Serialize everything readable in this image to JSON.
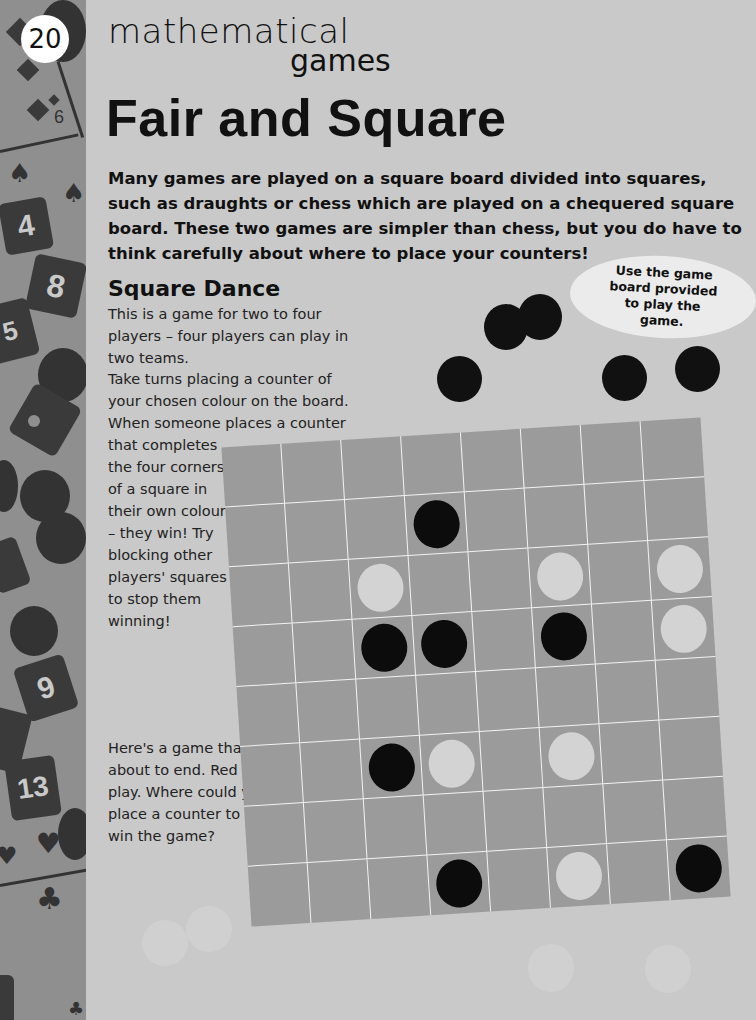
{
  "page": {
    "number": "20",
    "series_title": "mathematical",
    "series_subtitle": "games",
    "title": "Fair and Square",
    "intro": "Many games are played on a square board divided into squares, such as draughts or chess which are played on a chequered square board. These two games are simpler than chess, but you do have to think carefully about where to place your counters!"
  },
  "section": {
    "title": "Square Dance",
    "paragraph1": "This is a game for two to four players – four players can play in two teams.",
    "paragraph2": "Take turns placing a counter of your chosen colour on the board. When someone places a counter that completes the four corners of a square in their own colour – they win! Try blocking other players' squares to stop them winning!",
    "paragraph3": "Here's a game that is about to end. Red to play. Where could you place a counter to win the game?"
  },
  "note": {
    "text": "Use the game board provided to play the game."
  },
  "sidebar": {
    "card_numbers": [
      "6",
      "4",
      "8",
      "5",
      "9",
      "13"
    ],
    "suits": [
      "diamond",
      "spade",
      "heart",
      "club"
    ]
  },
  "board": {
    "rows": 8,
    "cols": 8,
    "colors": {
      "board": "#9b9b9b",
      "lines": "#f2f2f2",
      "black": "#0c0c0c",
      "white": "#d3d3d3"
    },
    "counters": [
      {
        "row": 1,
        "col": 3,
        "color": "black"
      },
      {
        "row": 2,
        "col": 2,
        "color": "white"
      },
      {
        "row": 2,
        "col": 5,
        "color": "white"
      },
      {
        "row": 2,
        "col": 7,
        "color": "white"
      },
      {
        "row": 3,
        "col": 2,
        "color": "black"
      },
      {
        "row": 3,
        "col": 3,
        "color": "black"
      },
      {
        "row": 3,
        "col": 5,
        "color": "black"
      },
      {
        "row": 3,
        "col": 7,
        "color": "white"
      },
      {
        "row": 5,
        "col": 2,
        "color": "black"
      },
      {
        "row": 5,
        "col": 3,
        "color": "white"
      },
      {
        "row": 5,
        "col": 5,
        "color": "white"
      },
      {
        "row": 7,
        "col": 3,
        "color": "black"
      },
      {
        "row": 7,
        "col": 5,
        "color": "white"
      },
      {
        "row": 7,
        "col": 7,
        "color": "black"
      }
    ]
  }
}
